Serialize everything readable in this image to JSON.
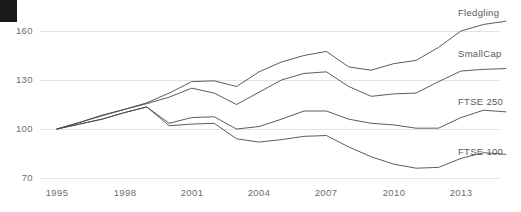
{
  "chart_data": {
    "type": "line",
    "title": "",
    "subtitle": "",
    "xlabel": "",
    "ylabel": "",
    "xlim": [
      1995,
      2015
    ],
    "ylim": [
      62,
      170
    ],
    "grid": true,
    "gridlines_y": [
      70,
      100,
      130,
      160
    ],
    "legend_position": "right-inline-end-of-line",
    "x": [
      1995,
      1996,
      1997,
      1998,
      1999,
      2000,
      2001,
      2002,
      2003,
      2004,
      2005,
      2006,
      2007,
      2008,
      2009,
      2010,
      2011,
      2012,
      2013,
      2014,
      2015
    ],
    "xticks": [
      1995,
      1998,
      2001,
      2004,
      2007,
      2010,
      2013
    ],
    "xtick_labels": [
      "1995",
      "1998",
      "2001",
      "2004",
      "2007",
      "2010",
      "2013"
    ],
    "yticks": [
      70,
      100,
      130,
      160
    ],
    "ytick_labels": [
      "70",
      "100",
      "130",
      "160"
    ],
    "series": [
      {
        "name": "Fledgling",
        "label": "Fledgling",
        "color": "#4a4a4a",
        "values": [
          100,
          104,
          108,
          112,
          116,
          122,
          129,
          129.5,
          126,
          135,
          141,
          145,
          147.5,
          138,
          136,
          140,
          142,
          150,
          160,
          164,
          166
        ]
      },
      {
        "name": "SmallCap",
        "label": "SmallCap",
        "color": "#4a4a4a",
        "values": [
          100,
          104,
          108.5,
          112,
          115.5,
          119.5,
          125,
          122,
          115,
          122.5,
          130,
          134,
          135,
          126,
          120,
          121.5,
          122,
          129,
          135.5,
          136.5,
          137
        ]
      },
      {
        "name": "FTSE 250",
        "label": "FTSE 250",
        "color": "#4a4a4a",
        "values": [
          100,
          103,
          106,
          110,
          113.5,
          103.5,
          107,
          107.5,
          100,
          101.5,
          106,
          111,
          111,
          106,
          103.5,
          102.5,
          100.5,
          100.5,
          107,
          111.5,
          110.5
        ]
      },
      {
        "name": "FTSE 100",
        "label": "FTSE 100",
        "color": "#4a4a4a",
        "values": [
          100,
          103,
          106,
          110,
          113.5,
          102,
          103,
          103.5,
          94,
          92,
          93.5,
          95.5,
          96,
          89,
          83,
          78.5,
          76,
          76.5,
          82,
          85.5,
          84.5
        ]
      }
    ]
  },
  "axis": {
    "y_labels": [
      "160",
      "130",
      "100",
      "70"
    ],
    "x_labels": [
      "1995",
      "1998",
      "2001",
      "2004",
      "2007",
      "2010",
      "2013"
    ]
  },
  "legend": {
    "items": [
      {
        "label": "Fledgling"
      },
      {
        "label": "SmallCap"
      },
      {
        "label": "FTSE 250"
      },
      {
        "label": "FTSE 100"
      }
    ]
  },
  "decor": {
    "corner_mark_color": "#1b1b1b",
    "grid_color": "#dcdcdc",
    "line_color": "#4a4a4a",
    "text_color": "#6d6d6d",
    "background": "#ffffff"
  }
}
